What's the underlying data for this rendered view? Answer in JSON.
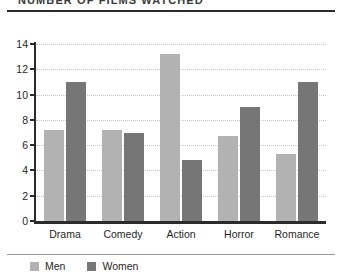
{
  "chart_data": {
    "type": "bar",
    "title": "NUMBER OF FILMS WATCHED",
    "subtitle": "",
    "xlabel": "",
    "ylabel": "",
    "categories": [
      "Drama",
      "Comedy",
      "Action",
      "Horror",
      "Romance"
    ],
    "series": [
      {
        "name": "Men",
        "color": "#b2b2b2",
        "values": [
          7.2,
          7.2,
          13.2,
          6.7,
          5.3
        ]
      },
      {
        "name": "Women",
        "color": "#767676",
        "values": [
          11.0,
          7.0,
          4.8,
          9.0,
          11.0
        ]
      }
    ],
    "ylim": [
      0,
      14
    ],
    "yticks": [
      0,
      2,
      4,
      6,
      8,
      10,
      12,
      14
    ],
    "ytick_labels": [
      "0",
      "2",
      "4",
      "6",
      "8",
      "10",
      "12",
      "14"
    ],
    "grid": true,
    "grid_axis": "y",
    "grid_style": "dotted",
    "legend": true,
    "legend_position": "bottom-left",
    "legend_entries": [
      "Men",
      "Women"
    ],
    "annotations": []
  },
  "figure": {
    "background": "#ffffff",
    "axis_color": "#2b2b2b",
    "grid_color": "#c8c8c8",
    "rule_top_color": "#2b2b2b",
    "rule_bottom_color": "#9a9a9a"
  }
}
